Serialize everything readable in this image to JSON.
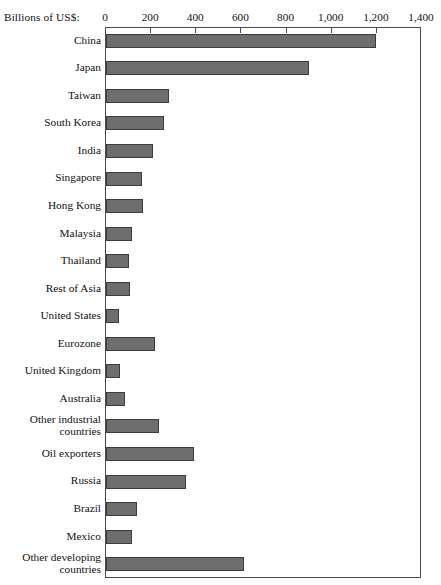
{
  "chart_data": {
    "type": "bar",
    "orientation": "horizontal",
    "title": "",
    "axis_caption": "Billions of US$:",
    "xlabel": "",
    "ylabel": "",
    "xlim": [
      0,
      1400
    ],
    "xticks": [
      "0",
      "200",
      "400",
      "600",
      "800",
      "1,000",
      "1,200",
      "1,400"
    ],
    "xtick_values": [
      0,
      200,
      400,
      600,
      800,
      1000,
      1200,
      1400
    ],
    "grid": false,
    "legend": false,
    "bar_color": "#6e6e6e",
    "bar_edge_color": "#3c3c3c",
    "frame_color": "#4a4a4a",
    "categories": [
      "China",
      "Japan",
      "Taiwan",
      "South Korea",
      "India",
      "Singapore",
      "Hong Kong",
      "Malaysia",
      "Thailand",
      "Rest of Asia",
      "United States",
      "Eurozone",
      "United Kingdom",
      "Australia",
      "Other industrial\ncountries",
      "Oil exporters",
      "Russia",
      "Brazil",
      "Mexico",
      "Other developing\ncountries"
    ],
    "values": [
      1195,
      900,
      280,
      258,
      210,
      160,
      165,
      115,
      100,
      108,
      58,
      218,
      62,
      85,
      235,
      390,
      355,
      138,
      115,
      610
    ]
  }
}
